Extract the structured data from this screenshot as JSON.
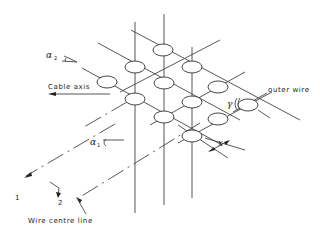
{
  "diagram": {
    "type": "cable wire geometry",
    "labels": {
      "cable_axis": "Cable axis",
      "outer_wire": "outer wire",
      "wire_centre_line": "Wire centre line",
      "alpha1": "α",
      "alpha1_sub": "1",
      "alpha2": "α",
      "alpha2_sub": "2",
      "gamma": "γ",
      "x": "x",
      "dir1": "1",
      "dir2": "2"
    },
    "wires": [
      {
        "cx": 163,
        "cy": 50
      },
      {
        "cx": 135,
        "cy": 67
      },
      {
        "cx": 192,
        "cy": 67
      },
      {
        "cx": 107,
        "cy": 82
      },
      {
        "cx": 164,
        "cy": 83
      },
      {
        "cx": 218,
        "cy": 87
      },
      {
        "cx": 135,
        "cy": 99
      },
      {
        "cx": 192,
        "cy": 102
      },
      {
        "cx": 248,
        "cy": 105
      },
      {
        "cx": 164,
        "cy": 117
      },
      {
        "cx": 218,
        "cy": 119
      },
      {
        "cx": 192,
        "cy": 136
      }
    ],
    "colors": {
      "line": "#444444",
      "background": "#ffffff"
    }
  }
}
